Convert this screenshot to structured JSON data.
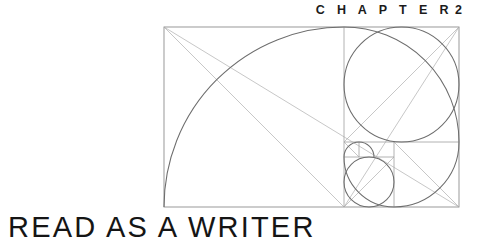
{
  "page": {
    "background_color": "#ffffff",
    "width": 484,
    "height": 248
  },
  "chapter_label": {
    "word": "C H A P T E R",
    "number": "2",
    "full_text": "CHAPTER 2",
    "color": "#1b1b1b"
  },
  "chapter_title": {
    "text": "READ AS A WRITER",
    "color": "#151515"
  },
  "diagram": {
    "name": "golden-ratio-fibonacci-spiral",
    "frame": {
      "x": 164,
      "y": 27,
      "width": 295,
      "height": 180
    },
    "ratio": "1.618",
    "colors": {
      "frame": "#8e8e8e",
      "grid": "#9a9a9a",
      "diagonal": "#a8a8a8",
      "spiral": "#6d6d6d"
    },
    "squares": 9,
    "spiral_turns": "2.25"
  }
}
